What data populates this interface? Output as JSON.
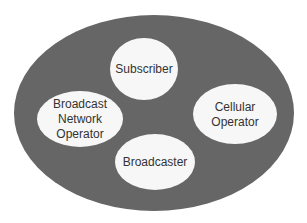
{
  "diagram": {
    "outer": {
      "cx": 154,
      "cy": 113,
      "rx": 140,
      "ry": 98,
      "fill": "#666666"
    },
    "nodes": [
      {
        "id": "subscriber",
        "lines": [
          "Subscriber"
        ],
        "cx": 144,
        "cy": 69,
        "rx": 34,
        "ry": 31
      },
      {
        "id": "broadcast-network-operator",
        "lines": [
          "Broadcast",
          "Network",
          "Operator"
        ],
        "cx": 80,
        "cy": 119,
        "rx": 43,
        "ry": 28
      },
      {
        "id": "cellular-operator",
        "lines": [
          "Cellular",
          "Operator"
        ],
        "cx": 235,
        "cy": 114,
        "rx": 42,
        "ry": 30
      },
      {
        "id": "broadcaster",
        "lines": [
          "Broadcaster"
        ],
        "cx": 155,
        "cy": 162,
        "rx": 40,
        "ry": 28
      }
    ],
    "node_fill": "#f7f7f7",
    "text_color": "#333333"
  }
}
